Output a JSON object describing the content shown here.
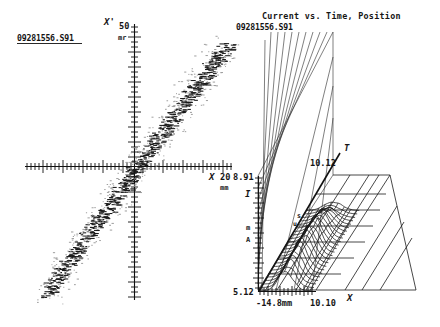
{
  "figure": {
    "background_color": "#ffffff",
    "ink_color": "#151515"
  },
  "left_panel": {
    "name": "phase-space-scatter",
    "file_label": "09281556.S91",
    "y_axis": {
      "symbol": "X'",
      "max_value": "50",
      "unit": "mr"
    },
    "x_axis": {
      "symbol": "X",
      "max_value": "20",
      "unit": "mm"
    }
  },
  "right_panel": {
    "name": "current-vs-time-position",
    "title": "Current vs. Time, Position",
    "file_label": "09281556.S91",
    "vertical_axis": {
      "symbol": "I",
      "unit_top": "m",
      "unit_bottom": "A",
      "max_value": "8.91",
      "min_value": "5.12"
    },
    "depth_axis": {
      "symbol": "T",
      "unit_top": "s",
      "unit_bottom": "u",
      "value": "10.12"
    },
    "horizontal_axis": {
      "symbol": "X",
      "min_label": "-14.8mm",
      "max_label": "10.10"
    }
  },
  "chart_data": [
    {
      "type": "scatter",
      "name": "phase-space-scatter",
      "title": "",
      "xlabel": "X",
      "ylabel": "X'",
      "xunit": "mm",
      "yunit": "mr",
      "xlim": [
        -20,
        20
      ],
      "ylim": [
        -50,
        50
      ],
      "grid": false,
      "legend": "none",
      "annotations": [
        "09281556.S91"
      ],
      "description": "Dense correlated diagonal beam phase-space distribution, positive slope through origin",
      "points": [
        [
          -17.8,
          -44.0
        ],
        [
          -17.2,
          -42.6
        ],
        [
          -16.6,
          -41.2
        ],
        [
          -16.0,
          -39.0
        ],
        [
          -15.4,
          -37.6
        ],
        [
          -14.8,
          -36.2
        ],
        [
          -14.2,
          -34.4
        ],
        [
          -13.6,
          -33.0
        ],
        [
          -13.0,
          -31.6
        ],
        [
          -12.4,
          -30.2
        ],
        [
          -11.8,
          -28.6
        ],
        [
          -11.2,
          -27.2
        ],
        [
          -10.6,
          -25.8
        ],
        [
          -10.0,
          -24.4
        ],
        [
          -9.4,
          -23.0
        ],
        [
          -8.8,
          -21.6
        ],
        [
          -8.2,
          -20.2
        ],
        [
          -7.6,
          -18.8
        ],
        [
          -7.0,
          -17.4
        ],
        [
          -6.4,
          -16.0
        ],
        [
          -5.8,
          -14.6
        ],
        [
          -5.2,
          -13.2
        ],
        [
          -4.6,
          -11.8
        ],
        [
          -4.0,
          -10.4
        ],
        [
          -3.4,
          -9.0
        ],
        [
          -2.8,
          -7.6
        ],
        [
          -2.2,
          -6.2
        ],
        [
          -1.6,
          -4.8
        ],
        [
          -1.0,
          -3.4
        ],
        [
          -0.4,
          -2.0
        ],
        [
          0.2,
          -0.6
        ],
        [
          0.8,
          0.8
        ],
        [
          1.4,
          2.2
        ],
        [
          2.0,
          3.6
        ],
        [
          2.6,
          5.0
        ],
        [
          3.2,
          6.4
        ],
        [
          3.8,
          7.8
        ],
        [
          4.4,
          9.2
        ],
        [
          5.0,
          10.6
        ],
        [
          5.6,
          12.0
        ],
        [
          6.2,
          13.4
        ],
        [
          6.8,
          14.8
        ],
        [
          7.4,
          16.2
        ],
        [
          8.0,
          17.6
        ],
        [
          8.6,
          19.0
        ],
        [
          9.2,
          20.4
        ],
        [
          9.8,
          21.8
        ],
        [
          10.4,
          23.2
        ],
        [
          11.0,
          24.6
        ],
        [
          11.6,
          26.0
        ],
        [
          12.2,
          27.4
        ],
        [
          12.8,
          28.8
        ],
        [
          13.4,
          30.2
        ],
        [
          14.0,
          31.6
        ],
        [
          14.6,
          33.0
        ],
        [
          15.2,
          34.4
        ],
        [
          15.8,
          35.8
        ],
        [
          16.4,
          37.2
        ],
        [
          17.0,
          38.6
        ],
        [
          17.6,
          40.0
        ],
        [
          18.2,
          41.4
        ],
        [
          18.8,
          42.8
        ]
      ]
    },
    {
      "type": "line",
      "name": "current-waterfall-3d",
      "title": "Current vs. Time, Position",
      "xlabel": "X",
      "ylabel": "I",
      "zlabel": "T",
      "xunit": "mm",
      "yunit": "mA",
      "zunit": "us",
      "xlim": [
        -14.8,
        10.1
      ],
      "ylim": [
        5.12,
        8.91
      ],
      "zlim": [
        0,
        10.12
      ],
      "grid": true,
      "legend": "none",
      "series_count": 24,
      "description": "Waterfall / mesh surface of beam current profiles stacked over time",
      "profiles_note": "Each trace is a bell-shaped current profile vs X at one time slice"
    }
  ]
}
